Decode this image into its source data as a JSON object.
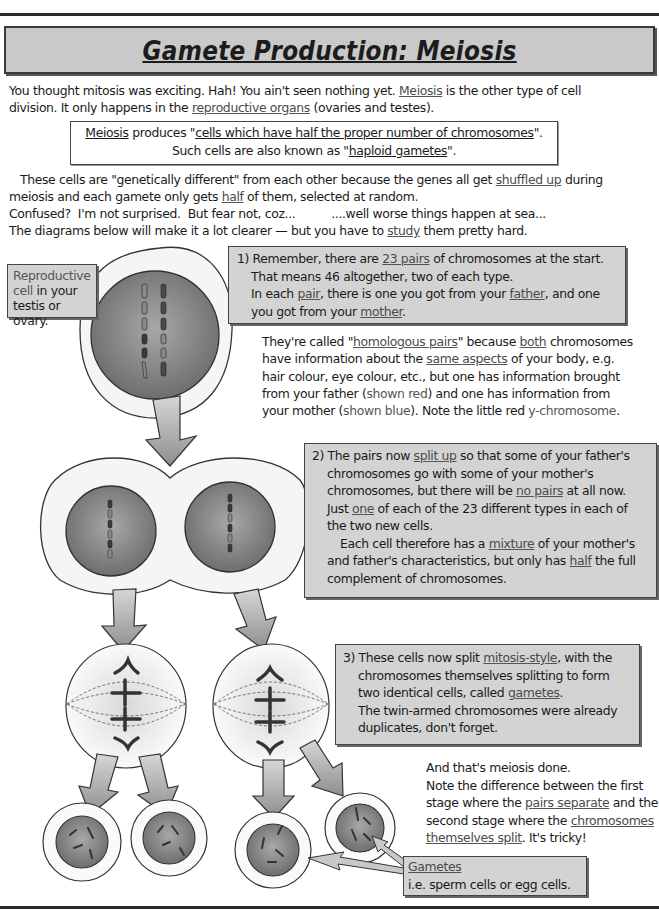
{
  "title": "Gamete Production: Meiosis",
  "intro": {
    "line1_a": "You thought mitosis was exciting.  Hah!  You ain't seen nothing yet.  ",
    "line1_link": "Meiosis",
    "line1_b": " is the other type of cell",
    "line2_a": "division.  It only happens in the ",
    "line2_link": "reproductive organs",
    "line2_b": " (ovaries and testes)."
  },
  "definition_box": {
    "word": "Meiosis",
    "produces": " produces \"",
    "quote": "cells which have half the proper number of chromosomes",
    "quote_end": "\".",
    "line2_a": "Such cells are also known as \"",
    "line2_link": "haploid gametes",
    "line2_b": "\"."
  },
  "explanation": {
    "l1_a": "These cells are \"genetically different\" from each other because the genes all get ",
    "l1_link": "shuffled up",
    "l1_b": " during",
    "l2_a": "meiosis and each gamete only gets ",
    "l2_link": "half",
    "l2_b": " of them, selected at random.",
    "l3": "Confused?  I'm not surprised.  But fear not, coz...          ....well worse things happen at sea...",
    "l4_a": "The diagrams below will make it a lot clearer — but you have to ",
    "l4_link": "study",
    "l4_b": " them pretty hard."
  },
  "label_reproductive": [
    "Reproductive",
    "cell in your",
    "testis or ovary."
  ],
  "step1": {
    "l1_a": "1) Remember, there are ",
    "l1_link": "23 pairs",
    "l1_b": " of chromosomes at the start.",
    "l2": "That means 46 altogether, two of each type.",
    "l3_a": "In each ",
    "l3_link1": "pair",
    "l3_b": ", there is one you got from your ",
    "l3_link2": "father",
    "l3_c": ", and one",
    "l4_a": "you got from your ",
    "l4_link": "mother",
    "l4_b": "."
  },
  "homologous": {
    "l1_a": "They're called \"",
    "l1_link1": "homologous pairs",
    "l1_b": "\" because ",
    "l1_link2": "both",
    "l1_c": " chromosomes",
    "l2_a": "have information about the ",
    "l2_link": "same aspects",
    "l2_b": " of your body, e.g.",
    "l3": "hair colour, eye colour, etc., but one has information brought",
    "l4_a": "from your father (",
    "l4_red": "shown red",
    "l4_b": ") and one has information from",
    "l5_a": "your mother (",
    "l5_blue": "shown blue",
    "l5_b": "). Note the little red ",
    "l5_y": "y-chromosome",
    "l5_c": "."
  },
  "step2": {
    "l1_a": "2) The pairs now ",
    "l1_link": "split up",
    "l1_b": " so that some of your father's",
    "l2": "chromosomes go with some of your mother's",
    "l3_a": "chromosomes, but there will be ",
    "l3_link": "no pairs",
    "l3_b": " at all now.",
    "l4_a": "Just ",
    "l4_link": "one",
    "l4_b": " of each of the 23 different types in each of",
    "l5": "the two new cells.",
    "l6_a": "Each cell therefore has a ",
    "l6_link": "mixture",
    "l6_b": " of your mother's",
    "l7_a": "and father's characteristics, but only has ",
    "l7_link": "half",
    "l7_b": " the full",
    "l8": "complement of chromosomes."
  },
  "step3": {
    "l1_a": "3) These cells now split ",
    "l1_link": "mitosis-style",
    "l1_b": ", with the",
    "l2": "chromosomes themselves splitting to form",
    "l3_a": "two identical cells, called ",
    "l3_link": "gametes",
    "l3_b": ".",
    "l4": "The twin-armed chromosomes were already",
    "l5": "duplicates, don't forget."
  },
  "conclusion": {
    "l1": "And that's meiosis done.",
    "l2": "Note the difference between the first",
    "l3_a": "stage where the ",
    "l3_link": "pairs separate",
    "l3_b": " and the",
    "l4_a": "second stage where the ",
    "l4_link": "chromosomes",
    "l5_link": "themselves split",
    "l5_b": ".  It's tricky!"
  },
  "gametes_label": {
    "title": "Gametes",
    "text": "i.e. sperm cells or egg cells."
  },
  "colors": {
    "box_fill": "#d3d3d3",
    "title_fill": "#c9c9c9",
    "nucleus": "#8a8a8a",
    "cell_ring": "#f4f4f4",
    "arrow": "#a5a5a5"
  }
}
